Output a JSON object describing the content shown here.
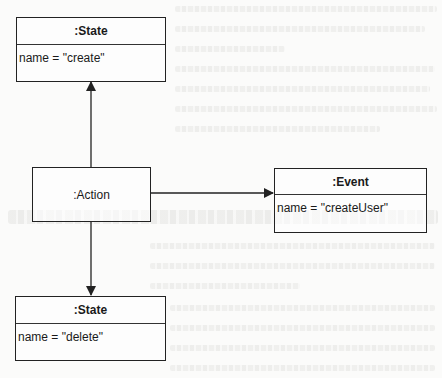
{
  "diagram": {
    "type": "uml-object-diagram",
    "nodes": [
      {
        "id": "state_create",
        "class_label": ":State",
        "attribute": "name = \"create\""
      },
      {
        "id": "action",
        "class_label": ":Action"
      },
      {
        "id": "event",
        "class_label": ":Event",
        "attribute": "name = \"createUser\""
      },
      {
        "id": "state_delete",
        "class_label": ":State",
        "attribute": "name = \"delete\""
      }
    ],
    "edges": [
      {
        "from": "action",
        "to": "state_create",
        "style": "solid-arrow"
      },
      {
        "from": "action",
        "to": "event",
        "style": "solid-arrow"
      },
      {
        "from": "action",
        "to": "state_delete",
        "style": "solid-arrow"
      }
    ],
    "colors": {
      "line": "#222222",
      "background": "#fbfbfa"
    }
  }
}
